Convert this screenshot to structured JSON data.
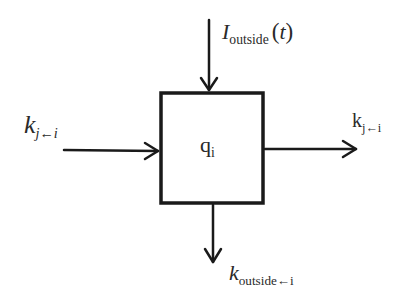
{
  "diagram": {
    "type": "compartment-flow",
    "node": {
      "id": "compartment",
      "label_main": "q",
      "label_sub": "i"
    },
    "inputs": [
      {
        "id": "outside-input",
        "direction": "from-top",
        "label_main": "I",
        "label_sub": "outside",
        "label_arg_open": "(",
        "label_arg": "t",
        "label_arg_close": ")"
      },
      {
        "id": "left-inflow",
        "direction": "from-left",
        "label_main": "k",
        "label_sub": "j←i"
      }
    ],
    "outputs": [
      {
        "id": "right-outflow",
        "direction": "to-right",
        "label_main": "k",
        "label_sub": "j←i"
      },
      {
        "id": "outside-outflow",
        "direction": "to-bottom",
        "label_main": "k",
        "label_sub": "outside←i"
      }
    ],
    "colors": {
      "stroke": "#1a1a1a",
      "text": "#2a2a2a",
      "background": "#ffffff"
    }
  }
}
